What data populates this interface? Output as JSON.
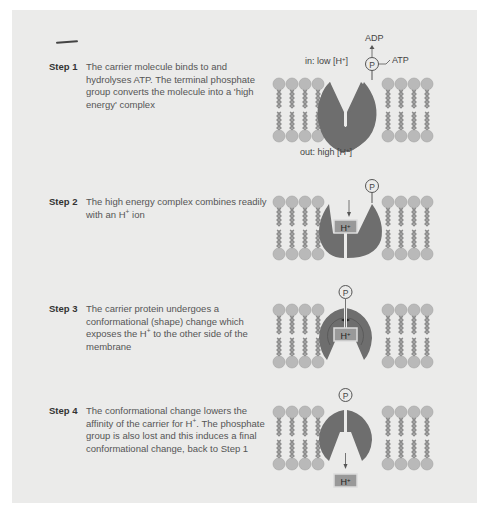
{
  "steps": [
    {
      "label": "Step 1",
      "text": "The carrier molecule binds to and hydrolyses ATP.  The terminal phosphate group converts the molecule into a 'high energy' complex"
    },
    {
      "label": "Step 2",
      "text_before": "The high energy complex combines readily with an H",
      "sup": "+",
      "text_after": " ion"
    },
    {
      "label": "Step 3",
      "text_before": "The carrier protein undergoes a conformational (shape) change which exposes the H",
      "sup": "+",
      "text_after": " to the other side of the membrane"
    },
    {
      "label": "Step 4",
      "text_before": "The conformational change lowers the affinity of the carrier for H",
      "sup": "+",
      "text_after": ". The phosphate group is also lost and this induces a final conformational change, back to Step 1"
    }
  ],
  "diagram": {
    "in_label": "in: low [H",
    "out_label": "out: high [H",
    "plus": "+",
    "close_bracket": "]",
    "adp": "ADP",
    "atp": "ATP",
    "phosphate": "P",
    "hydrogen_ion": "H",
    "colors": {
      "panel_bg": "#ebebea",
      "protein": "#6e6e6e",
      "lipid_head": "#b9b9b9",
      "lipid_tail": "#8a8a8a",
      "h_box": "#999999"
    }
  }
}
